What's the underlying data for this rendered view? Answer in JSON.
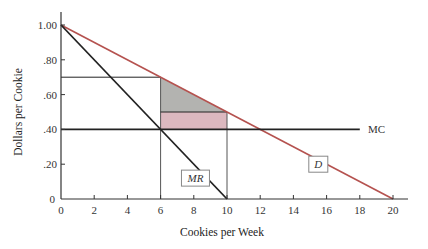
{
  "chart_data": {
    "type": "line",
    "title": "",
    "xlabel": "Cookies per Week",
    "ylabel": "Dollars per Cookie",
    "xlim": [
      0,
      21
    ],
    "ylim": [
      0,
      1.05
    ],
    "grid": false,
    "x_ticks": [
      0,
      2,
      4,
      6,
      8,
      10,
      12,
      14,
      16,
      18,
      20
    ],
    "x_tick_labels": [
      "0",
      "2",
      "4",
      "6",
      "8",
      "10",
      "12",
      "14",
      "16",
      "18",
      "20"
    ],
    "y_ticks": [
      0,
      0.2,
      0.4,
      0.6,
      0.8,
      1.0
    ],
    "y_tick_labels": [
      "0",
      ".20",
      ".40",
      ".60",
      ".80",
      "1.00"
    ],
    "series": [
      {
        "name": "D",
        "label": "D",
        "color": "#b5524f",
        "points": [
          [
            0,
            1.0
          ],
          [
            20,
            0.0
          ]
        ]
      },
      {
        "name": "MR",
        "label": "MR",
        "color": "#222222",
        "points": [
          [
            0,
            1.0
          ],
          [
            10,
            0.0
          ]
        ]
      },
      {
        "name": "MC",
        "label": "MC",
        "color": "#222222",
        "points": [
          [
            0,
            0.4
          ],
          [
            18,
            0.4
          ]
        ]
      }
    ],
    "reference_lines": [
      {
        "name": "price-line",
        "points": [
          [
            0,
            0.7
          ],
          [
            6,
            0.7
          ]
        ],
        "color": "#222222"
      },
      {
        "name": "quantity-6-line",
        "points": [
          [
            6,
            0
          ],
          [
            6,
            0.7
          ]
        ],
        "color": "#555555"
      },
      {
        "name": "quantity-10-line",
        "points": [
          [
            10,
            0
          ],
          [
            10,
            0.5
          ]
        ],
        "color": "#555555"
      },
      {
        "name": "price-50-line",
        "points": [
          [
            6,
            0.5
          ],
          [
            10,
            0.5
          ]
        ],
        "color": "#222222"
      }
    ],
    "shaded_regions": [
      {
        "name": "deadweight-loss-triangle",
        "points": [
          [
            6,
            0.7
          ],
          [
            6,
            0.5
          ],
          [
            10,
            0.5
          ]
        ],
        "color": "#b3b3b0"
      },
      {
        "name": "rectangle-region",
        "points": [
          [
            6,
            0.5
          ],
          [
            10,
            0.5
          ],
          [
            10,
            0.4
          ],
          [
            6,
            0.4
          ]
        ],
        "color": "#dcb8bf"
      }
    ],
    "annotations": [
      {
        "text": "MR",
        "x": 8.1,
        "y": 0.12,
        "boxed": true,
        "italic": true
      },
      {
        "text": "D",
        "x": 15.5,
        "y": 0.2,
        "boxed": true,
        "italic": true
      },
      {
        "text": "MC",
        "x": 18.5,
        "y": 0.4,
        "boxed": false,
        "italic": false
      }
    ]
  }
}
